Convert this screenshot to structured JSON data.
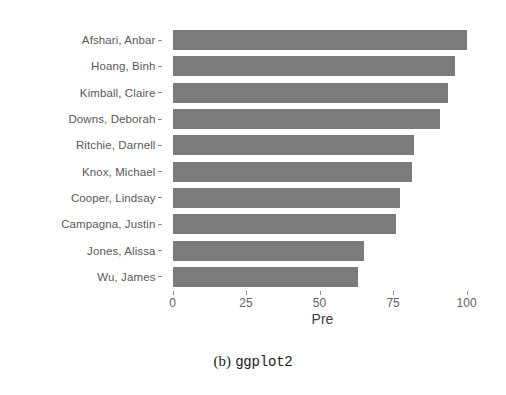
{
  "caption": {
    "index": "(b)",
    "name": "ggplot2"
  },
  "chart_data": {
    "type": "bar",
    "orientation": "horizontal",
    "title": "",
    "subtitle": "",
    "xlabel": "Pre",
    "ylabel": "",
    "categories": [
      "Afshari, Anbar",
      "Hoang, Binh",
      "Kimball, Claire",
      "Downs, Deborah",
      "Ritchie, Darnell",
      "Knox, Michael",
      "Cooper, Lindsay",
      "Campagna, Justin",
      "Jones, Alissa",
      "Wu, James"
    ],
    "values": [
      100,
      96,
      93.5,
      91,
      82,
      81.5,
      77.5,
      76,
      65,
      63
    ],
    "xlim": [
      0,
      102
    ],
    "xticks": [
      0,
      25,
      50,
      75,
      100
    ],
    "xticklabels": [
      "0",
      "25",
      "50",
      "75",
      "100"
    ],
    "grid": false,
    "legend": null,
    "bar_color": "#7b7b7b",
    "background": "#ffffff"
  }
}
